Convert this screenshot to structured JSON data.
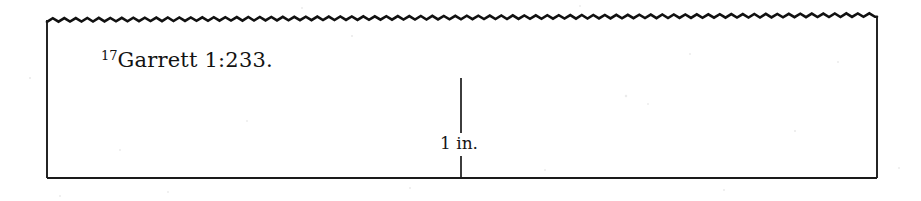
{
  "figure": {
    "kind": "scanned-book-figure-panel",
    "background_color": "#ffffff",
    "ink_color": "#111111",
    "border": {
      "left_x": 47,
      "right_x": 877,
      "bottom_y": 178,
      "top_y": 18,
      "stroke_width": 2,
      "top_edge_style": "torn-zigzag-wave",
      "zigzag_period_px": 11.5,
      "zigzag_amplitude_px": 3.5
    },
    "footnote": {
      "marker": "17",
      "text": "Garrett 1:233.",
      "full_text": "17Garrett 1:233.",
      "x": 103,
      "baseline_y": 68
    },
    "scale_bar": {
      "label": "1 in.",
      "orientation": "vertical",
      "x": 461,
      "top_y": 78,
      "bottom_y": 178,
      "label_gap_top_y": 134,
      "label_gap_bottom_y": 156,
      "label_x": 440,
      "label_y": 145
    }
  }
}
